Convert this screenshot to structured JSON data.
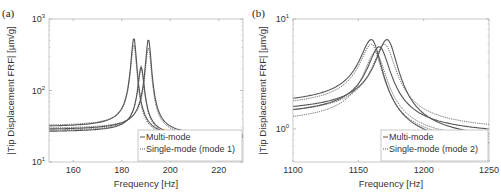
{
  "chart_data": [
    {
      "panel_label": "(a)",
      "type": "line",
      "title": "",
      "xlabel": "Frequency [Hz]",
      "ylabel": "|Tip Displacement FRF| [µm/g]",
      "xscale": "linear",
      "yscale": "log",
      "xlim": [
        150,
        230
      ],
      "ylim": [
        10,
        1000
      ],
      "xticks": [
        160,
        180,
        200,
        220
      ],
      "yticks": [
        {
          "value": 10,
          "label_base": "10",
          "label_exp": "1"
        },
        {
          "value": 100,
          "label_base": "10",
          "label_exp": "2"
        },
        {
          "value": 1000,
          "label_base": "10",
          "label_exp": "3"
        }
      ],
      "grid": false,
      "legend": {
        "position": "lower right",
        "entries": [
          "Multi-mode",
          "Single-mode (mode 1)"
        ]
      },
      "series": [
        {
          "name": "Multi-mode",
          "style": "solid",
          "peak_freq": 185,
          "peak_value": 540,
          "low_value": 32,
          "high_value": 22
        },
        {
          "name": "Multi-mode",
          "style": "solid",
          "peak_freq": 191,
          "peak_value": 520,
          "low_value": 29,
          "high_value": 24
        },
        {
          "name": "Multi-mode",
          "style": "solid",
          "peak_freq": 188,
          "peak_value": 215,
          "low_value": 27,
          "high_value": 23
        },
        {
          "name": "Single-mode (mode 1)",
          "style": "dotted",
          "peak_freq": 185,
          "peak_value": 440,
          "low_value": 33,
          "high_value": 21
        },
        {
          "name": "Single-mode (mode 1)",
          "style": "dotted",
          "peak_freq": 191,
          "peak_value": 400,
          "low_value": 30,
          "high_value": 23
        },
        {
          "name": "Single-mode (mode 1)",
          "style": "dotted",
          "peak_freq": 188,
          "peak_value": 200,
          "low_value": 28,
          "high_value": 22
        }
      ]
    },
    {
      "panel_label": "(b)",
      "type": "line",
      "title": "",
      "xlabel": "Frequency [Hz]",
      "ylabel": "|Tip Displacement FRF| [µm/g]",
      "xscale": "linear",
      "yscale": "log",
      "xlim": [
        1100,
        1250
      ],
      "ylim": [
        0.5,
        10
      ],
      "xticks": [
        1100,
        1150,
        1200,
        1250
      ],
      "yticks": [
        {
          "value": 1,
          "label_base": "10",
          "label_exp": "0"
        },
        {
          "value": 10,
          "label_base": "10",
          "label_exp": "1"
        }
      ],
      "grid": false,
      "legend": {
        "position": "lower right",
        "entries": [
          "Multi-mode",
          "Single-mode (mode 2)"
        ]
      },
      "series": [
        {
          "name": "Multi-mode",
          "style": "solid",
          "peak_freq": 1160,
          "peak_value": 6.5,
          "low_value": 1.9,
          "high_value": 0.75
        },
        {
          "name": "Multi-mode",
          "style": "solid",
          "peak_freq": 1172,
          "peak_value": 6.5,
          "low_value": 1.6,
          "high_value": 0.9
        },
        {
          "name": "Multi-mode",
          "style": "solid",
          "peak_freq": 1166,
          "peak_value": 5.6,
          "low_value": 1.5,
          "high_value": 1.0
        },
        {
          "name": "Single-mode (mode 2)",
          "style": "dotted",
          "peak_freq": 1160,
          "peak_value": 5.9,
          "low_value": 1.8,
          "high_value": 0.8
        },
        {
          "name": "Single-mode (mode 2)",
          "style": "dotted",
          "peak_freq": 1170,
          "peak_value": 5.9,
          "low_value": 1.5,
          "high_value": 1.1
        },
        {
          "name": "Single-mode (mode 2)",
          "style": "dotted",
          "peak_freq": 1163,
          "peak_value": 5.0,
          "low_value": 1.3,
          "high_value": 0.85
        }
      ]
    }
  ],
  "layout": {
    "panels": [
      {
        "box": {
          "x0": 49,
          "y0": 19,
          "x1": 243,
          "y1": 162
        },
        "legend_box": {
          "x": 138,
          "y": 130,
          "w": 104,
          "h": 31
        }
      },
      {
        "box": {
          "x0": 293,
          "y0": 19,
          "x1": 489,
          "y1": 162
        },
        "legend_box": {
          "x": 381,
          "y": 130,
          "w": 107,
          "h": 31
        }
      }
    ],
    "colors": {
      "line": "#555555",
      "axis": "#bbbbbb",
      "text": "#333333"
    }
  }
}
